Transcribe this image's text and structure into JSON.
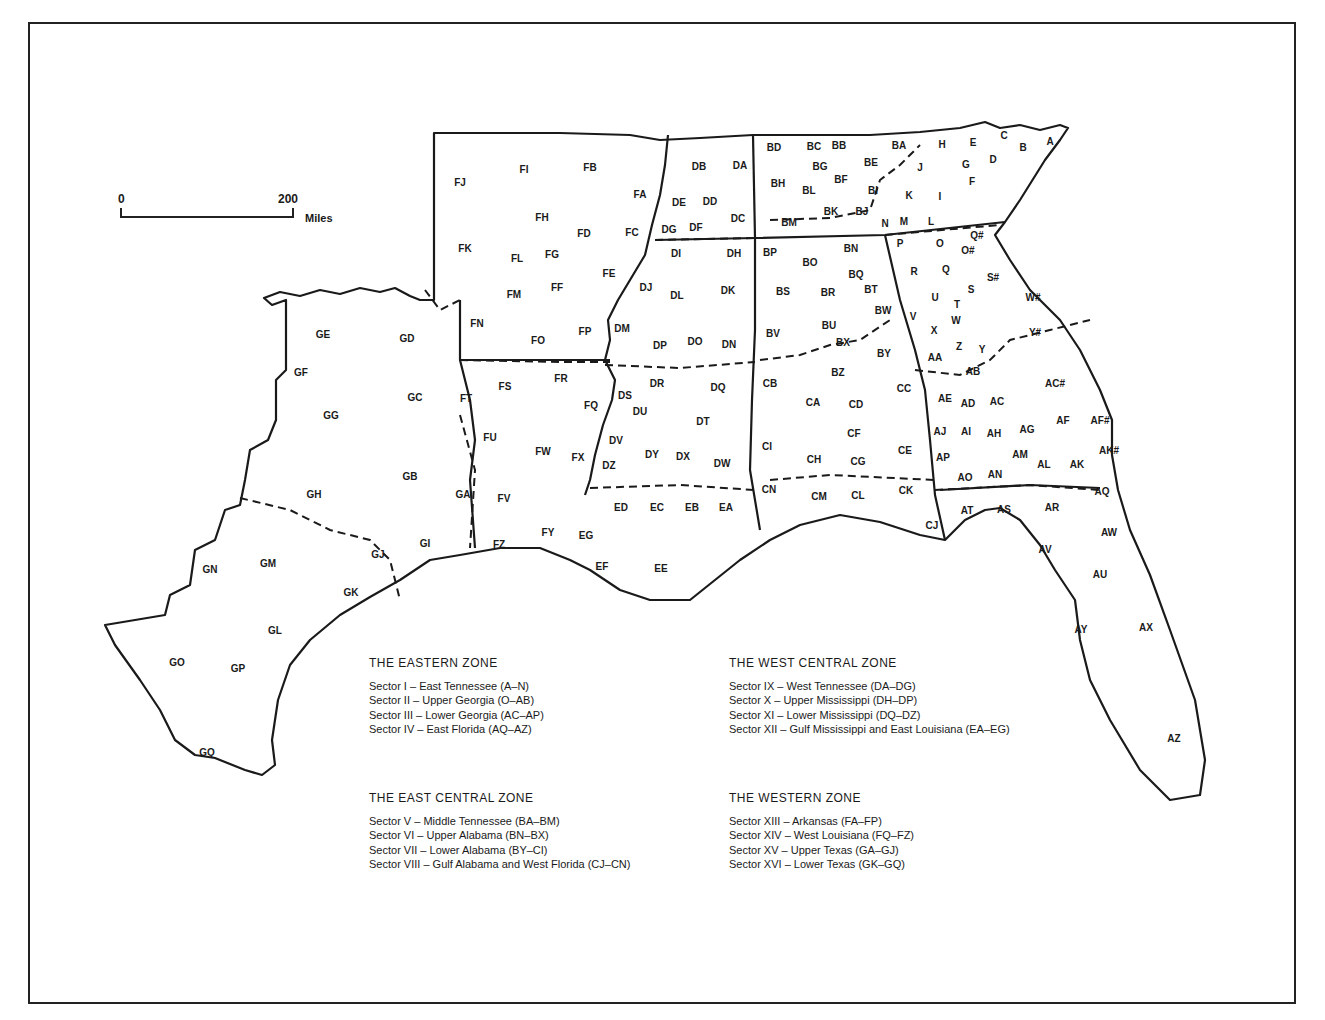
{
  "scale_bar": {
    "start_label": "0",
    "end_label": "200",
    "unit": "Miles"
  },
  "zones": [
    {
      "title": "THE EASTERN ZONE",
      "sectors": [
        "Sector I – East Tennessee (A–N)",
        "Sector II – Upper Georgia (O–AB)",
        "Sector III – Lower Georgia (AC–AP)",
        "Sector IV – East Florida (AQ–AZ)"
      ]
    },
    {
      "title": "THE WEST CENTRAL ZONE",
      "sectors": [
        "Sector IX – West Tennessee (DA–DG)",
        "Sector X – Upper Mississippi (DH–DP)",
        "Sector XI – Lower Mississippi (DQ–DZ)",
        "Sector XII – Gulf Mississippi and East Louisiana (EA–EG)"
      ]
    },
    {
      "title": "THE EAST CENTRAL ZONE",
      "sectors": [
        "Sector V – Middle Tennessee (BA–BM)",
        "Sector VI – Upper Alabama (BN–BX)",
        "Sector VII – Lower Alabama (BY–CI)",
        "Sector VIII – Gulf Alabama and West Florida (CJ–CN)"
      ]
    },
    {
      "title": "THE WESTERN ZONE",
      "sectors": [
        "Sector XIII – Arkansas (FA–FP)",
        "Sector XIV – West Louisiana (FQ–FZ)",
        "Sector XV – Upper Texas (GA–GJ)",
        "Sector XVI – Lower Texas (GK–GQ)"
      ]
    }
  ],
  "region_labels": [
    [
      "A",
      1050,
      142
    ],
    [
      "B",
      1023,
      148
    ],
    [
      "C",
      1004,
      136
    ],
    [
      "D",
      993,
      160
    ],
    [
      "E",
      973,
      143
    ],
    [
      "F",
      972,
      182
    ],
    [
      "G",
      966,
      165
    ],
    [
      "H",
      942,
      145
    ],
    [
      "I",
      940,
      197
    ],
    [
      "J",
      920,
      168
    ],
    [
      "K",
      909,
      196
    ],
    [
      "L",
      931,
      222
    ],
    [
      "M",
      904,
      222
    ],
    [
      "N",
      885,
      224
    ],
    [
      "O",
      940,
      244
    ],
    [
      "P",
      900,
      244
    ],
    [
      "Q",
      946,
      270
    ],
    [
      "R",
      914,
      272
    ],
    [
      "S",
      971,
      290
    ],
    [
      "T",
      957,
      305
    ],
    [
      "U",
      935,
      298
    ],
    [
      "V",
      913,
      317
    ],
    [
      "W",
      956,
      321
    ],
    [
      "X",
      934,
      331
    ],
    [
      "Y",
      982,
      350
    ],
    [
      "Z",
      959,
      347
    ],
    [
      "Q#",
      977,
      236
    ],
    [
      "O#",
      968,
      251
    ],
    [
      "S#",
      993,
      278
    ],
    [
      "W#",
      1033,
      298
    ],
    [
      "Y#",
      1035,
      333
    ],
    [
      "AA",
      935,
      358
    ],
    [
      "AB",
      973,
      372
    ],
    [
      "AC",
      997,
      402
    ],
    [
      "AC#",
      1055,
      384
    ],
    [
      "AD",
      968,
      404
    ],
    [
      "AE",
      945,
      399
    ],
    [
      "AF",
      1063,
      421
    ],
    [
      "AF#",
      1100,
      421
    ],
    [
      "AG",
      1027,
      430
    ],
    [
      "AH",
      994,
      434
    ],
    [
      "AI",
      966,
      432
    ],
    [
      "AJ",
      940,
      432
    ],
    [
      "AK",
      1077,
      465
    ],
    [
      "AK#",
      1109,
      451
    ],
    [
      "AL",
      1044,
      465
    ],
    [
      "AM",
      1020,
      455
    ],
    [
      "AN",
      995,
      475
    ],
    [
      "AO",
      965,
      478
    ],
    [
      "AP",
      943,
      458
    ],
    [
      "AQ",
      1102,
      492
    ],
    [
      "AR",
      1052,
      508
    ],
    [
      "AS",
      1004,
      510
    ],
    [
      "AT",
      967,
      511
    ],
    [
      "AU",
      1100,
      575
    ],
    [
      "AV",
      1045,
      550
    ],
    [
      "AW",
      1109,
      533
    ],
    [
      "AX",
      1146,
      628
    ],
    [
      "AY",
      1081,
      630
    ],
    [
      "AZ",
      1174,
      739
    ],
    [
      "BA",
      899,
      146
    ],
    [
      "BB",
      839,
      146
    ],
    [
      "BC",
      814,
      147
    ],
    [
      "BD",
      774,
      148
    ],
    [
      "BE",
      871,
      163
    ],
    [
      "BF",
      841,
      180
    ],
    [
      "BG",
      820,
      167
    ],
    [
      "BH",
      778,
      184
    ],
    [
      "BI",
      873,
      191
    ],
    [
      "BJ",
      862,
      212
    ],
    [
      "BK",
      831,
      212
    ],
    [
      "BL",
      809,
      191
    ],
    [
      "BM",
      789,
      223
    ],
    [
      "BN",
      851,
      249
    ],
    [
      "BO",
      810,
      263
    ],
    [
      "BP",
      770,
      253
    ],
    [
      "BQ",
      856,
      275
    ],
    [
      "BR",
      828,
      293
    ],
    [
      "BS",
      783,
      292
    ],
    [
      "BT",
      871,
      290
    ],
    [
      "BU",
      829,
      326
    ],
    [
      "BV",
      773,
      334
    ],
    [
      "BW",
      883,
      311
    ],
    [
      "BX",
      843,
      343
    ],
    [
      "BY",
      884,
      354
    ],
    [
      "BZ",
      838,
      373
    ],
    [
      "CA",
      813,
      403
    ],
    [
      "CB",
      770,
      384
    ],
    [
      "CC",
      904,
      389
    ],
    [
      "CD",
      856,
      405
    ],
    [
      "CE",
      905,
      451
    ],
    [
      "CF",
      854,
      434
    ],
    [
      "CG",
      858,
      462
    ],
    [
      "CH",
      814,
      460
    ],
    [
      "CI",
      767,
      447
    ],
    [
      "CJ",
      932,
      526
    ],
    [
      "CK",
      906,
      491
    ],
    [
      "CL",
      858,
      496
    ],
    [
      "CM",
      819,
      497
    ],
    [
      "CN",
      769,
      490
    ],
    [
      "DA",
      740,
      166
    ],
    [
      "DB",
      699,
      167
    ],
    [
      "DC",
      738,
      219
    ],
    [
      "DD",
      710,
      202
    ],
    [
      "DE",
      679,
      203
    ],
    [
      "DF",
      696,
      228
    ],
    [
      "DG",
      669,
      230
    ],
    [
      "DH",
      734,
      254
    ],
    [
      "DI",
      676,
      254
    ],
    [
      "DJ",
      646,
      288
    ],
    [
      "DK",
      728,
      291
    ],
    [
      "DL",
      677,
      296
    ],
    [
      "DM",
      622,
      329
    ],
    [
      "DN",
      729,
      345
    ],
    [
      "DO",
      695,
      342
    ],
    [
      "DP",
      660,
      346
    ],
    [
      "DQ",
      718,
      388
    ],
    [
      "DR",
      657,
      384
    ],
    [
      "DS",
      625,
      396
    ],
    [
      "DT",
      703,
      422
    ],
    [
      "DU",
      640,
      412
    ],
    [
      "DV",
      616,
      441
    ],
    [
      "DW",
      722,
      464
    ],
    [
      "DX",
      683,
      457
    ],
    [
      "DY",
      652,
      455
    ],
    [
      "DZ",
      609,
      466
    ],
    [
      "EA",
      726,
      508
    ],
    [
      "EB",
      692,
      508
    ],
    [
      "EC",
      657,
      508
    ],
    [
      "ED",
      621,
      508
    ],
    [
      "EE",
      661,
      569
    ],
    [
      "EF",
      602,
      567
    ],
    [
      "EG",
      586,
      536
    ],
    [
      "FA",
      640,
      195
    ],
    [
      "FB",
      590,
      168
    ],
    [
      "FC",
      632,
      233
    ],
    [
      "FD",
      584,
      234
    ],
    [
      "FE",
      609,
      274
    ],
    [
      "FF",
      557,
      288
    ],
    [
      "FG",
      552,
      255
    ],
    [
      "FH",
      542,
      218
    ],
    [
      "FI",
      524,
      170
    ],
    [
      "FJ",
      460,
      183
    ],
    [
      "FK",
      465,
      249
    ],
    [
      "FL",
      517,
      259
    ],
    [
      "FM",
      514,
      295
    ],
    [
      "FN",
      477,
      324
    ],
    [
      "FO",
      538,
      341
    ],
    [
      "FP",
      585,
      332
    ],
    [
      "FQ",
      591,
      406
    ],
    [
      "FR",
      561,
      379
    ],
    [
      "FS",
      505,
      387
    ],
    [
      "FT",
      466,
      399
    ],
    [
      "FU",
      490,
      438
    ],
    [
      "FV",
      504,
      499
    ],
    [
      "FW",
      543,
      452
    ],
    [
      "FX",
      578,
      458
    ],
    [
      "FY",
      548,
      533
    ],
    [
      "FZ",
      499,
      545
    ],
    [
      "GA",
      463,
      495
    ],
    [
      "GB",
      410,
      477
    ],
    [
      "GC",
      415,
      398
    ],
    [
      "GD",
      407,
      339
    ],
    [
      "GE",
      323,
      335
    ],
    [
      "GF",
      301,
      373
    ],
    [
      "GG",
      331,
      416
    ],
    [
      "GH",
      314,
      495
    ],
    [
      "GI",
      425,
      544
    ],
    [
      "GJ",
      378,
      555
    ],
    [
      "GK",
      351,
      593
    ],
    [
      "GL",
      275,
      631
    ],
    [
      "GM",
      268,
      564
    ],
    [
      "GN",
      210,
      570
    ],
    [
      "GO",
      177,
      663
    ],
    [
      "GP",
      238,
      669
    ],
    [
      "GQ",
      207,
      753
    ]
  ]
}
